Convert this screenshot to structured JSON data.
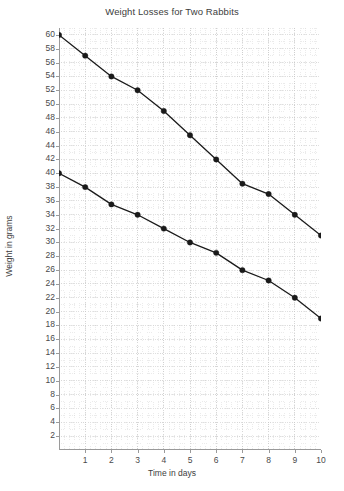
{
  "chart_data": {
    "type": "line",
    "title": "Weight Losses for Two Rabbits",
    "xlabel": "Time in days",
    "ylabel": "Weight in grams",
    "x": [
      0,
      1,
      2,
      3,
      4,
      5,
      6,
      7,
      8,
      9,
      10
    ],
    "xlim": [
      0,
      10
    ],
    "ylim": [
      0,
      61
    ],
    "xticks": [
      1,
      2,
      3,
      4,
      5,
      6,
      7,
      8,
      9,
      10
    ],
    "yticks": [
      2,
      4,
      6,
      8,
      10,
      12,
      14,
      16,
      18,
      20,
      22,
      24,
      26,
      28,
      30,
      32,
      34,
      36,
      38,
      40,
      42,
      44,
      46,
      48,
      50,
      52,
      54,
      56,
      58,
      60
    ],
    "grid": true,
    "legend": "none",
    "series": [
      {
        "name": "Rabbit 1",
        "color": "#1a1a1a",
        "values": [
          60,
          57,
          54,
          52,
          49,
          45.5,
          42,
          38.5,
          37,
          34,
          31
        ]
      },
      {
        "name": "Rabbit 2",
        "color": "#1a1a1a",
        "values": [
          40,
          38,
          35.5,
          34,
          32,
          30,
          28.5,
          26,
          24.5,
          22,
          19
        ]
      }
    ]
  }
}
